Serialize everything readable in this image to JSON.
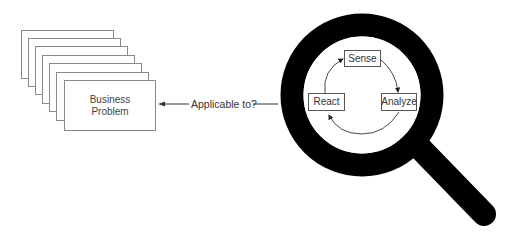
{
  "diagram": {
    "problem_stack": {
      "page_count": 7,
      "front_label_lines": [
        "Business",
        "Problem"
      ]
    },
    "connector": {
      "label": "Applicable to?",
      "direction": "points-to-problem-stack"
    },
    "magnifier": {
      "ring_color": "#000000",
      "cycle": {
        "stages": [
          {
            "id": "sense",
            "label": "Sense"
          },
          {
            "id": "analyze",
            "label": "Analyze"
          },
          {
            "id": "react",
            "label": "React"
          }
        ],
        "flow": [
          "Sense",
          "Analyze",
          "React",
          "Sense"
        ]
      }
    },
    "colors": {
      "page_border": "#8a8a8a",
      "text": "#333333",
      "ring": "#000000"
    }
  }
}
